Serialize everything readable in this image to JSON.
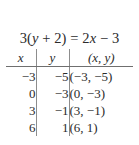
{
  "equation": {
    "full": "3(y + 2) = 2x − 3",
    "lhs_coefficient": "3",
    "lhs_open": "(",
    "lhs_var": "y",
    "lhs_plus": " + 2)",
    "equals": " = ",
    "rhs_coefficient": "2",
    "rhs_var": "x",
    "rhs_tail": " − 3"
  },
  "table": {
    "headers": {
      "x": "x",
      "y": "y",
      "pair": "(x, y)"
    },
    "rows": [
      {
        "x": "−3",
        "y": "−5",
        "pair": "(−3, −5)"
      },
      {
        "x": "0",
        "y": "−3",
        "pair": "(0, −3)"
      },
      {
        "x": "3",
        "y": "−1",
        "pair": "(3, −1)"
      },
      {
        "x": "6",
        "y": "1",
        "pair": "(6, 1)"
      }
    ]
  },
  "colors": {
    "text": "#2b2b2b",
    "rule": "#6f6f6f",
    "divider": "#8d8d8d",
    "background": "#ffffff"
  }
}
